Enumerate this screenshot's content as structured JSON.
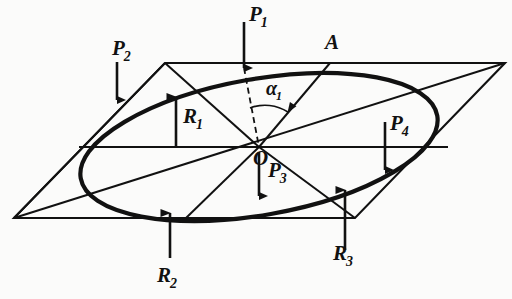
{
  "figure": {
    "background_color": "#fbfbfa",
    "stroke_color": "#111111"
  },
  "labels": {
    "point_a": {
      "base": "A",
      "sub": ""
    },
    "point_o": {
      "base": "O",
      "sub": ""
    },
    "angle_alpha1": {
      "base": "α",
      "sub": "1"
    },
    "force_p1": {
      "base": "P",
      "sub": "1"
    },
    "force_p2": {
      "base": "P",
      "sub": "2"
    },
    "force_p3": {
      "base": "P",
      "sub": "3"
    },
    "force_p4": {
      "base": "P",
      "sub": "4"
    },
    "reaction_r1": {
      "base": "R",
      "sub": "1"
    },
    "reaction_r2": {
      "base": "R",
      "sub": "2"
    },
    "reaction_r3": {
      "base": "R",
      "sub": "3"
    }
  },
  "geometry": {
    "parallelogram": {
      "top_left": [
        165,
        63
      ],
      "top_right": [
        505,
        63
      ],
      "bottom_right": [
        355,
        218
      ],
      "bottom_left": [
        14,
        218
      ]
    },
    "ellipse": {
      "center": [
        259,
        147
      ],
      "radius_x": 181,
      "radius_y": 68,
      "rotation_deg": -10
    },
    "center_point": [
      259,
      147
    ],
    "point_a": [
      330,
      63
    ],
    "arrows": {
      "p1": {
        "from": [
          244,
          22
        ],
        "to": [
          244,
          68
        ],
        "direction": "down"
      },
      "p2": {
        "from": [
          117,
          62
        ],
        "to": [
          117,
          100
        ],
        "direction": "down"
      },
      "p3": {
        "from": [
          259,
          152
        ],
        "to": [
          259,
          196
        ],
        "direction": "down"
      },
      "p4": {
        "from": [
          385,
          122
        ],
        "to": [
          385,
          170
        ],
        "direction": "down"
      },
      "r1": {
        "from": [
          176,
          147
        ],
        "to": [
          176,
          97
        ],
        "direction": "up"
      },
      "r2": {
        "from": [
          170,
          258
        ],
        "to": [
          170,
          213
        ],
        "direction": "up"
      },
      "r3": {
        "from": [
          345,
          250
        ],
        "to": [
          345,
          190
        ],
        "direction": "up"
      }
    }
  }
}
